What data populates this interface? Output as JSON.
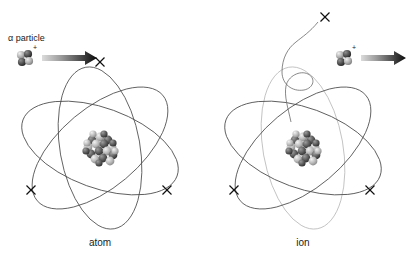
{
  "figure": {
    "background_color": "#ffffff",
    "width": 409,
    "height": 260
  },
  "labels": {
    "alpha_particle": "α particle",
    "charge_sign": "+",
    "atom_caption": "atom",
    "ion_caption": "ion"
  },
  "colors": {
    "orbit_stroke": "#4a4a4a",
    "orbit_faded_stroke": "#b9b9b9",
    "electron_stroke": "#111111",
    "arrow_gradient_start": "#d8d8d8",
    "arrow_gradient_end": "#0a0a0a",
    "nucleon_light": "#c9c9c9",
    "nucleon_dark": "#4f4f4f",
    "text": "#1a1a1a"
  },
  "left_panel": {
    "name": "atom",
    "caption": "atom",
    "caption_position": {
      "x": 100,
      "y": 246
    },
    "center": {
      "x": 100,
      "y": 148
    },
    "electron_count": 3,
    "orbit_count": 3,
    "orbits": [
      {
        "rx": 82,
        "ry": 40,
        "rotation": 20
      },
      {
        "rx": 82,
        "ry": 40,
        "rotation": 80
      },
      {
        "rx": 82,
        "ry": 40,
        "rotation": 140
      }
    ],
    "electrons": [
      {
        "id": "electron-top",
        "x": 100,
        "y": 62,
        "size": 9
      },
      {
        "id": "electron-bottom-left",
        "x": 31,
        "y": 190,
        "size": 9
      },
      {
        "id": "electron-bottom-right",
        "x": 167,
        "y": 190,
        "size": 9
      }
    ],
    "nucleus": {
      "x": 100,
      "y": 148,
      "radius": 15,
      "nucleon_count": 30
    }
  },
  "right_panel": {
    "name": "ion",
    "caption": "ion",
    "caption_position": {
      "x": 303,
      "y": 246
    },
    "center": {
      "x": 303,
      "y": 148
    },
    "electron_count": 2,
    "orbit_count": 3,
    "orbits": [
      {
        "rx": 82,
        "ry": 40,
        "rotation": 20,
        "faded": false
      },
      {
        "rx": 82,
        "ry": 40,
        "rotation": 140,
        "faded": false
      },
      {
        "rx": 82,
        "ry": 40,
        "rotation": 80,
        "faded": true
      }
    ],
    "electrons": [
      {
        "id": "electron-bottom-left",
        "x": 234,
        "y": 190,
        "size": 9
      },
      {
        "id": "electron-bottom-right",
        "x": 370,
        "y": 190,
        "size": 9
      }
    ],
    "nucleus": {
      "x": 303,
      "y": 148,
      "radius": 15,
      "nucleon_count": 30
    },
    "ejected_electron": {
      "id": "ejected-electron",
      "x": 325,
      "y": 17,
      "size": 9
    }
  },
  "alpha_particles": [
    {
      "id": "alpha-particle-incoming",
      "cluster_center": {
        "x": 25,
        "y": 58
      },
      "charge_position": {
        "x": 35,
        "y": 47
      },
      "arrow": {
        "x1": 42,
        "y1": 58,
        "x2": 95,
        "y2": 58
      },
      "label": "α particle",
      "label_position": {
        "x": 8,
        "y": 41
      }
    },
    {
      "id": "alpha-particle-outgoing",
      "cluster_center": {
        "x": 344,
        "y": 58
      },
      "charge_position": {
        "x": 354,
        "y": 47
      },
      "arrow": {
        "x1": 361,
        "y1": 58,
        "x2": 404,
        "y2": 58
      },
      "label": "",
      "label_position": null
    }
  ],
  "ejection_path": {
    "description": "spiral trajectory of the ejected electron",
    "start": {
      "x": 292,
      "y": 120
    },
    "end": {
      "x": 318,
      "y": 19
    }
  }
}
